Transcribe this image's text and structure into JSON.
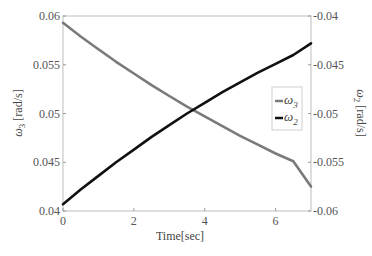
{
  "chart_data": {
    "type": "line",
    "title": "",
    "xlabel": "Time[sec]",
    "ylabel_left": "ω3 [rad/s]",
    "ylabel_right": "ω2 [rad/s]",
    "xlim": [
      0,
      7
    ],
    "ylim_left": [
      0.04,
      0.06
    ],
    "ylim_right": [
      -0.06,
      -0.04
    ],
    "x_ticks": [
      0,
      2,
      4,
      6
    ],
    "x_tick_labels": [
      "0",
      "2",
      "4",
      "6"
    ],
    "y_left_ticks": [
      0.04,
      0.045,
      0.05,
      0.055,
      0.06
    ],
    "y_left_tick_labels": [
      "0.04",
      "0.045",
      "0.05",
      "0.055",
      "0.06"
    ],
    "y_right_ticks": [
      -0.06,
      -0.055,
      -0.05,
      -0.045,
      -0.04
    ],
    "y_right_tick_labels": [
      "-0.06",
      "-0.055",
      "-0.05",
      "-0.045",
      "-0.04"
    ],
    "grid": false,
    "legend_position": "center-right",
    "x": [
      0,
      0.5,
      1,
      1.5,
      2,
      2.5,
      3,
      3.5,
      4,
      4.5,
      5,
      5.5,
      6,
      6.5,
      7
    ],
    "series": [
      {
        "name": "ω3",
        "axis": "left",
        "color": "#7a7a7a",
        "values": [
          0.0593,
          0.0579,
          0.0566,
          0.0553,
          0.0541,
          0.0529,
          0.0518,
          0.0507,
          0.0497,
          0.0487,
          0.0477,
          0.0468,
          0.0459,
          0.0451,
          0.0425
        ]
      },
      {
        "name": "ω2",
        "axis": "right",
        "color": "#111111",
        "values": [
          -0.0593,
          -0.0578,
          -0.0564,
          -0.055,
          -0.0537,
          -0.0524,
          -0.0512,
          -0.05,
          -0.0489,
          -0.0478,
          -0.0468,
          -0.0458,
          -0.0449,
          -0.044,
          -0.0428
        ]
      }
    ]
  },
  "legend": {
    "items": [
      {
        "label": "ω",
        "sub": "3",
        "color": "#7a7a7a"
      },
      {
        "label": "ω",
        "sub": "2",
        "color": "#111111"
      }
    ]
  },
  "axes": {
    "xlabel": "Time[sec]",
    "ylabel_left_symbol": "ω",
    "ylabel_left_sub": "3",
    "ylabel_left_unit": " [rad/s]",
    "ylabel_right_symbol": "ω",
    "ylabel_right_sub": "2",
    "ylabel_right_unit": " [rad/s]"
  }
}
